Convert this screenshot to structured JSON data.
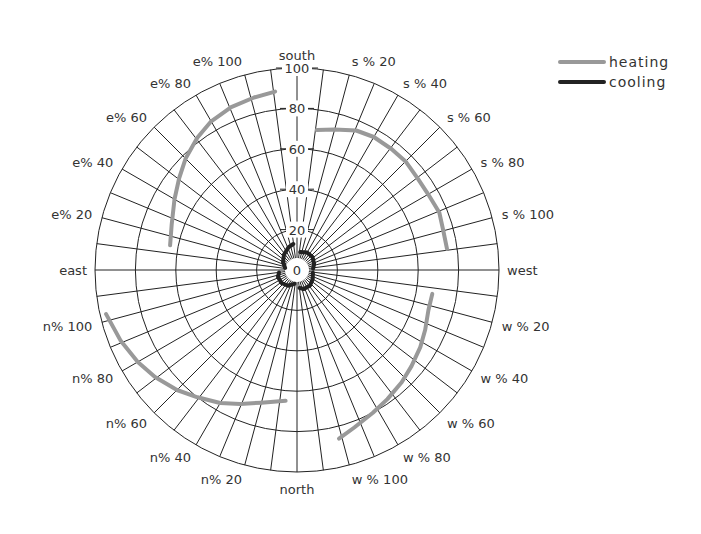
{
  "chart_data": {
    "type": "polar-line",
    "title": "",
    "radial_axis": {
      "ticks": [
        0,
        20,
        40,
        60,
        80,
        100
      ],
      "range": [
        0,
        100
      ]
    },
    "angular_divisions_per_quadrant": 12,
    "direction_labels": [
      {
        "text": "south",
        "angle": 90
      },
      {
        "text": "west",
        "angle": 0
      },
      {
        "text": "north",
        "angle": 270
      },
      {
        "text": "east",
        "angle": 180
      }
    ],
    "quadrant_labels": [
      {
        "text": "s % 20",
        "angle": 75
      },
      {
        "text": "s % 40",
        "angle": 60
      },
      {
        "text": "s % 60",
        "angle": 45
      },
      {
        "text": "s % 80",
        "angle": 30
      },
      {
        "text": "s % 100",
        "angle": 15
      },
      {
        "text": "w % 20",
        "angle": -15
      },
      {
        "text": "w % 40",
        "angle": -30
      },
      {
        "text": "w % 60",
        "angle": -45
      },
      {
        "text": "w % 80",
        "angle": -60
      },
      {
        "text": "w % 100",
        "angle": -75
      },
      {
        "text": "n% 20",
        "angle": 255
      },
      {
        "text": "n% 40",
        "angle": 240
      },
      {
        "text": "n% 60",
        "angle": 225
      },
      {
        "text": "n% 80",
        "angle": 210
      },
      {
        "text": "n% 100",
        "angle": 195
      },
      {
        "text": "e% 20",
        "angle": 165
      },
      {
        "text": "e% 40",
        "angle": 150
      },
      {
        "text": "e% 60",
        "angle": 135
      },
      {
        "text": "e% 80",
        "angle": 120
      },
      {
        "text": "e% 100",
        "angle": 105
      }
    ],
    "series": [
      {
        "name": "heating",
        "color": "#999999",
        "segments": [
          {
            "quadrant": "south-west",
            "points": [
              [
                82,
                70
              ],
              [
                75,
                72
              ],
              [
                67,
                75
              ],
              [
                60,
                76
              ],
              [
                52,
                76
              ],
              [
                45,
                76
              ],
              [
                37,
                75
              ],
              [
                30,
                75
              ],
              [
                22,
                76
              ],
              [
                15,
                75
              ],
              [
                8,
                75
              ]
            ]
          },
          {
            "quadrant": "west-north",
            "points": [
              [
                -10,
                68
              ],
              [
                -17,
                68
              ],
              [
                -25,
                70
              ],
              [
                -32,
                72
              ],
              [
                -40,
                74
              ],
              [
                -47,
                76
              ],
              [
                -55,
                78
              ],
              [
                -62,
                80
              ],
              [
                -70,
                83
              ],
              [
                -76,
                86
              ]
            ]
          },
          {
            "quadrant": "north-east",
            "points": [
              [
                265,
                65
              ],
              [
                255,
                68
              ],
              [
                247,
                72
              ],
              [
                240,
                76
              ],
              [
                232,
                80
              ],
              [
                225,
                84
              ],
              [
                217,
                88
              ],
              [
                210,
                91
              ],
              [
                202,
                94
              ],
              [
                193,
                97
              ]
            ]
          },
          {
            "quadrant": "east-south",
            "points": [
              [
                169,
                64
              ],
              [
                160,
                66
              ],
              [
                150,
                70
              ],
              [
                142,
                74
              ],
              [
                135,
                78
              ],
              [
                127,
                82
              ],
              [
                120,
                85
              ],
              [
                112,
                87
              ],
              [
                104,
                88
              ],
              [
                97,
                89
              ]
            ]
          }
        ]
      },
      {
        "name": "cooling",
        "color": "#222222",
        "segments": [
          {
            "quadrant": "south-west",
            "points": [
              [
                80,
                9
              ],
              [
                60,
                10
              ],
              [
                40,
                10
              ],
              [
                20,
                9
              ],
              [
                5,
                8
              ]
            ]
          },
          {
            "quadrant": "west-north",
            "points": [
              [
                -10,
                8
              ],
              [
                -30,
                9
              ],
              [
                -50,
                10
              ],
              [
                -70,
                10
              ],
              [
                -82,
                9
              ]
            ]
          },
          {
            "quadrant": "north-east",
            "points": [
              [
                260,
                7
              ],
              [
                240,
                9
              ],
              [
                220,
                10
              ],
              [
                200,
                10
              ],
              [
                188,
                9
              ]
            ]
          },
          {
            "quadrant": "east-south",
            "points": [
              [
                170,
                6
              ],
              [
                150,
                8
              ],
              [
                130,
                10
              ],
              [
                110,
                12
              ],
              [
                98,
                13
              ]
            ]
          }
        ]
      }
    ],
    "legend": {
      "position": "top-right",
      "entries": [
        "heating",
        "cooling"
      ]
    }
  },
  "legend": [
    {
      "label": "heating",
      "color": "#999999"
    },
    {
      "label": "cooling",
      "color": "#222222"
    }
  ]
}
